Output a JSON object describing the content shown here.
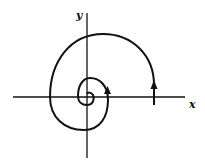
{
  "figure": {
    "type": "phase-portrait-spiral",
    "x_axis_label": "x",
    "y_axis_label": "y",
    "direction": "inward spiral toward origin, counterclockwise",
    "arrows": 2
  }
}
